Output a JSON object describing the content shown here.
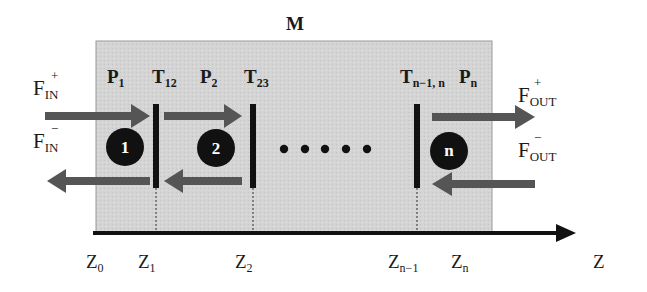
{
  "title": "M",
  "colors": {
    "box_fill": "#d3d3d3",
    "box_stroke": "#9a9a9a",
    "arrow": "#555555",
    "barrier": "#111111",
    "circle": "#111111",
    "axis": "#111111"
  },
  "flux": {
    "in_plus": {
      "base": "F",
      "sub": "IN",
      "sup": "+"
    },
    "in_minus": {
      "base": "F",
      "sub": "IN",
      "sup": "−"
    },
    "out_plus": {
      "base": "F",
      "sub": "OUT",
      "sup": "+"
    },
    "out_minus": {
      "base": "F",
      "sub": "OUT",
      "sup": "−"
    }
  },
  "regions": [
    {
      "base": "P",
      "sub": "1"
    },
    {
      "base": "P",
      "sub": "2"
    },
    {
      "base": "P",
      "sub": "n"
    }
  ],
  "barriers": [
    {
      "base": "T",
      "sub": "12"
    },
    {
      "base": "T",
      "sub": "23"
    },
    {
      "base": "T",
      "sub": "n−1, n"
    }
  ],
  "compartments": [
    "1",
    "2",
    "n"
  ],
  "ellipsis_dots": 5,
  "axis": {
    "label": "Z",
    "ticks": [
      {
        "base": "Z",
        "sub": "0"
      },
      {
        "base": "Z",
        "sub": "1"
      },
      {
        "base": "Z",
        "sub": "2"
      },
      {
        "base": "Z",
        "sub": "n−1"
      },
      {
        "base": "Z",
        "sub": "n"
      }
    ]
  }
}
